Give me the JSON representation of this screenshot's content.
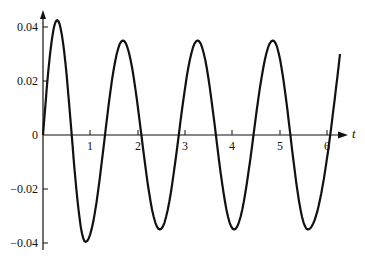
{
  "chart_data": {
    "type": "line",
    "title": "",
    "xlabel": "t",
    "ylabel": "",
    "xlim": [
      0,
      6.35
    ],
    "ylim": [
      -0.042,
      0.047
    ],
    "grid": false,
    "legend": null,
    "x_ticks": [
      1,
      2,
      3,
      4,
      5,
      6
    ],
    "x_tick_labels": [
      "1",
      "2",
      "3",
      "4",
      "5",
      "6"
    ],
    "y_ticks": [
      0.04,
      0.02,
      0,
      -0.02,
      -0.04
    ],
    "y_tick_labels": [
      "0.04",
      "0.02",
      "0",
      "-0.02",
      "-0.04"
    ],
    "series": [
      {
        "name": "response",
        "description": "Oscillation with initial transient settling to steady amplitude ~0.035, period ~1.58",
        "x": [
          0,
          0.3,
          0.9,
          1.69,
          2.47,
          3.27,
          4.04,
          4.86,
          5.6,
          6.28
        ],
        "y": [
          0,
          0.0425,
          -0.0396,
          0.035,
          -0.035,
          0.035,
          -0.035,
          0.035,
          -0.035,
          0.03
        ]
      }
    ]
  },
  "labels": {
    "x_axis": "t",
    "ticks_x": [
      "1",
      "2",
      "3",
      "4",
      "5",
      "6"
    ],
    "ticks_y": [
      "0.04",
      "0.02",
      "0",
      "−0.02",
      "−0.04"
    ]
  }
}
